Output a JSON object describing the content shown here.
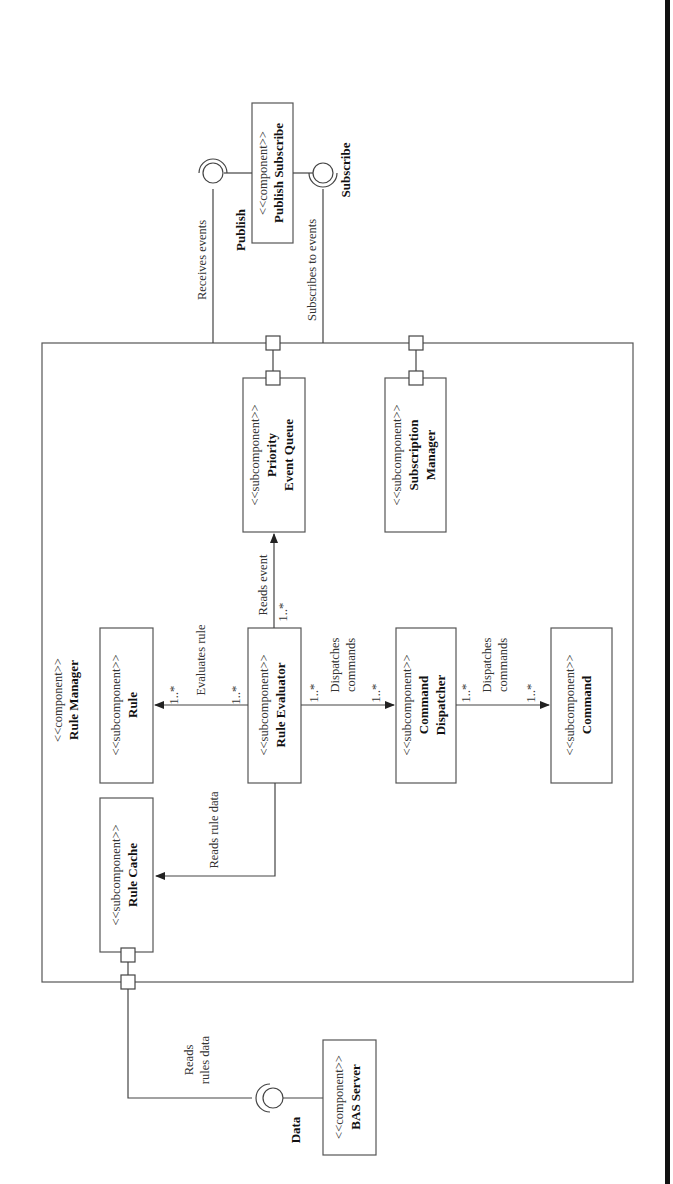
{
  "diagram": {
    "type": "UML component diagram",
    "orientation": "rotated 90 degrees counter-clockwise",
    "container": {
      "stereotype": "<<component>>",
      "name": "Rule Manager"
    },
    "external_components": {
      "publish_subscribe": {
        "stereotype": "<<component>>",
        "name": "Publish Subscribe"
      },
      "bas_server": {
        "stereotype": "<<component>>",
        "name": "BAS Server"
      }
    },
    "interfaces": {
      "publish": "Publish",
      "subscribe": "Subscribe",
      "data": "Data"
    },
    "subcomponents": {
      "priority_event_queue": {
        "stereotype": "<<subcomponent>>",
        "name_line1": "Priority",
        "name_line2": "Event Queue"
      },
      "subscription_manager": {
        "stereotype": "<<subcomponent>>",
        "name_line1": "Subscription",
        "name_line2": "Manager"
      },
      "rule": {
        "stereotype": "<<subcomponent>>",
        "name": "Rule"
      },
      "rule_evaluator": {
        "stereotype": "<<subcomponent>>",
        "name": "Rule Evaluator"
      },
      "command_dispatcher": {
        "stereotype": "<<subcomponent>>",
        "name_line1": "Command",
        "name_line2": "Dispatcher"
      },
      "command": {
        "stereotype": "<<subcomponent>>",
        "name": "Command"
      },
      "rule_cache": {
        "stereotype": "<<subcomponent>>",
        "name": "Rule Cache"
      }
    },
    "connections": {
      "receives_events": "Receives events",
      "subscribes_to_events": "Subscribes to events",
      "reads_event": "Reads event",
      "evaluates_rule": "Evaluates rule",
      "dispatches_commands_1_line1": "Dispatches",
      "dispatches_commands_1_line2": "commands",
      "dispatches_commands_2_line1": "Dispatches",
      "dispatches_commands_2_line2": "commands",
      "reads_rule_data": "Reads rule data",
      "reads_rules_data_line1": "Reads",
      "reads_rules_data_line2": "rules data"
    },
    "multiplicities": {
      "reads_event_src": "1..*",
      "evaluates_rule_src": "1..*",
      "evaluates_rule_dst": "1..*",
      "dispatch1_src": "1..*",
      "dispatch1_dst": "1..*",
      "dispatch2_src": "1..*",
      "dispatch2_dst": "1..*"
    }
  }
}
